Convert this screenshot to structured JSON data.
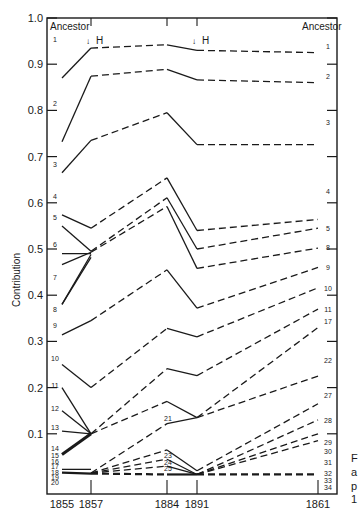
{
  "chart_data": {
    "type": "line",
    "title": "",
    "xlabel": "",
    "ylabel": "Contribution",
    "ylim": [
      0.0,
      1.0
    ],
    "yticks": [
      "1.0",
      "0.9",
      "0.8",
      "0.7",
      "0.6",
      "0.5",
      "0.4",
      "0.3",
      "0.2",
      "0.1"
    ],
    "x": [
      "1855",
      "1857",
      "1884",
      "1891",
      "1861"
    ],
    "left_header": "Ancestor",
    "right_header": "Ancestor",
    "annotations": [
      {
        "text": "H",
        "x": "1857",
        "marker": "arrow-down"
      },
      {
        "text": "H",
        "x": "1891",
        "marker": "arrow-down"
      }
    ],
    "left_labels": [
      "1",
      "2",
      "3",
      "4",
      "5",
      "6",
      "7",
      "8",
      "9",
      "10",
      "11",
      "12",
      "13",
      "14",
      "15",
      "16",
      "17",
      "18",
      "19",
      "20"
    ],
    "right_labels": [
      "1",
      "2",
      "3",
      "4",
      "5",
      "8",
      "9",
      "10",
      "11",
      "17",
      "22",
      "27",
      "28",
      "29",
      "30",
      "31",
      "32",
      "33",
      "34"
    ],
    "mid_labels": [
      "21",
      "23",
      "24",
      "25"
    ],
    "series": [
      {
        "name": "1",
        "values": [
          0.87,
          0.935,
          0.942,
          0.93,
          0.925
        ]
      },
      {
        "name": "2",
        "values": [
          0.732,
          0.874,
          0.889,
          0.866,
          0.86
        ]
      },
      {
        "name": "3",
        "values": [
          0.665,
          0.735,
          0.795,
          0.726,
          0.726
        ]
      },
      {
        "name": "4",
        "values": [
          0.574,
          0.545,
          0.654,
          0.54,
          0.564
        ]
      },
      {
        "name": "5",
        "values": [
          0.55,
          0.495,
          0.611,
          0.5,
          0.545
        ]
      },
      {
        "name": "7",
        "values": [
          0.466,
          0.493,
          0.592,
          0.458,
          0.502
        ]
      },
      {
        "name": "8",
        "values": [
          0.38,
          0.488,
          null,
          null,
          null
        ]
      },
      {
        "name": "9",
        "values": [
          0.314,
          0.345,
          0.455,
          0.372,
          0.46
        ]
      },
      {
        "name": "10",
        "values": [
          0.25,
          0.2,
          0.328,
          0.31,
          0.416
        ]
      },
      {
        "name": "11",
        "values": [
          0.2,
          0.1,
          0.241,
          0.226,
          0.37
        ]
      },
      {
        "name": "12",
        "values": [
          0.15,
          0.1,
          null,
          null,
          null
        ]
      },
      {
        "name": "13",
        "values": [
          0.106,
          0.1,
          null,
          null,
          null
        ]
      },
      {
        "name": "15-16",
        "values": [
          0.055,
          0.1,
          0.17,
          0.135,
          0.33
        ]
      },
      {
        "name": "21",
        "values": [
          null,
          0.015,
          0.122,
          0.135,
          0.225
        ]
      },
      {
        "name": "23",
        "values": [
          null,
          0.015,
          0.065,
          0.02,
          0.165
        ]
      },
      {
        "name": "24",
        "values": [
          null,
          0.015,
          0.045,
          0.012,
          0.13
        ]
      },
      {
        "name": "25",
        "values": [
          null,
          0.015,
          0.03,
          0.012,
          0.1
        ]
      },
      {
        "name": "17",
        "values": [
          0.023,
          0.023,
          null,
          0.012,
          0.085
        ]
      },
      {
        "name": "18-20",
        "values": [
          0.016,
          0.014,
          0.012,
          0.012,
          0.012
        ]
      }
    ]
  },
  "caption_fragment": [
    "F",
    "a",
    "p",
    "1"
  ]
}
